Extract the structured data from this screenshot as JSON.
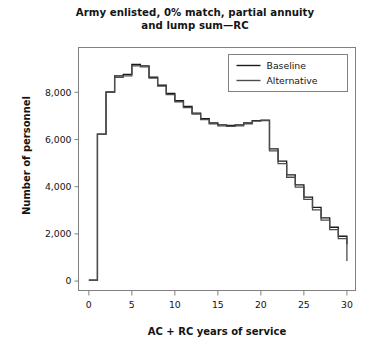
{
  "chart_data": {
    "type": "line",
    "title": "Army enlisted, 0% match, partial annuity and lump sum—RC",
    "title_line1": "Army enlisted, 0% match, partial annuity",
    "title_line2": "and lump sum—RC",
    "xlabel": "AC + RC years of service",
    "ylabel": "Number of personnel",
    "xlim": [
      -1.2,
      31
    ],
    "ylim": [
      -400,
      9900
    ],
    "xticks": [
      0,
      5,
      10,
      15,
      20,
      25,
      30
    ],
    "xticklabels": [
      "0",
      "5",
      "10",
      "15",
      "20",
      "25",
      "30"
    ],
    "yticks": [
      0,
      2000,
      4000,
      6000,
      8000
    ],
    "yticklabels": [
      "0",
      "2,000",
      "4,000",
      "6,000",
      "8,000"
    ],
    "grid": false,
    "drawstyle": "steps-post",
    "legend_position": "top-right",
    "legend": [
      "Baseline",
      "Alternative"
    ],
    "x": [
      0,
      1,
      2,
      3,
      4,
      5,
      6,
      7,
      8,
      9,
      10,
      11,
      12,
      13,
      14,
      15,
      16,
      17,
      18,
      19,
      20,
      21,
      22,
      23,
      24,
      25,
      26,
      27,
      28,
      29,
      30
    ],
    "series": [
      {
        "name": "Baseline",
        "color": "#1a1a1a",
        "values": [
          40,
          6230,
          8020,
          8700,
          8760,
          9180,
          9120,
          8640,
          8300,
          7950,
          7650,
          7400,
          7120,
          6880,
          6700,
          6620,
          6600,
          6620,
          6700,
          6800,
          6820,
          5600,
          5080,
          4500,
          4080,
          3560,
          3120,
          2680,
          2280,
          1900,
          1560
        ]
      },
      {
        "name": "Alternative",
        "color": "#4d4d4d",
        "values": [
          40,
          6230,
          8000,
          8640,
          8700,
          9120,
          9080,
          8600,
          8260,
          7900,
          7600,
          7350,
          7080,
          6840,
          6660,
          6580,
          6560,
          6580,
          6660,
          6780,
          6800,
          5520,
          4980,
          4400,
          3980,
          3460,
          3020,
          2580,
          2180,
          1800,
          850
        ]
      }
    ]
  },
  "axes": {
    "frame_color": "#808080"
  }
}
